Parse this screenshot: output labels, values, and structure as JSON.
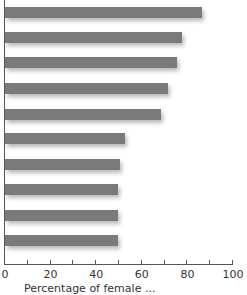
{
  "chart_data": {
    "type": "bar",
    "orientation": "horizontal",
    "title": "",
    "categories": [
      "",
      "",
      "",
      "",
      "",
      "",
      "",
      "",
      "",
      ""
    ],
    "values": [
      87,
      78,
      76,
      72,
      69,
      53,
      51,
      50,
      50,
      50
    ],
    "xlabel": "Percentage of female ...",
    "ylabel": "",
    "xlim": [
      0,
      100
    ],
    "xticks": [
      0,
      20,
      40,
      60,
      80,
      100
    ],
    "minor_xticks": [
      10,
      30,
      50,
      70,
      90
    ],
    "grid": false,
    "legend": null,
    "bar_color": "#7a7a7a"
  },
  "axis": {
    "tick_labels": [
      "0",
      "20",
      "40",
      "60",
      "80",
      "100"
    ],
    "xlabel": "Percentage of female ..."
  }
}
